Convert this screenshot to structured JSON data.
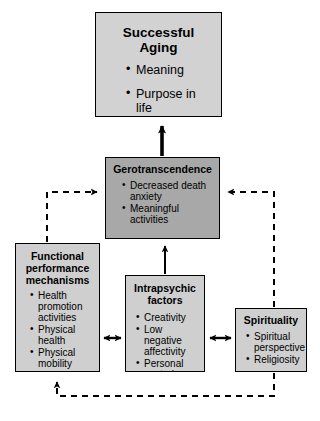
{
  "diagram": {
    "colors": {
      "top_box_fill": "#d2d2d2",
      "gerotranscendence_fill": "#a8a8a8",
      "factor_box_fill": "#cfcfcf",
      "border": "#000000",
      "background": "#ffffff"
    },
    "nodes": {
      "successful_aging": {
        "title": "Successful Aging",
        "items": [
          "Meaning",
          "Purpose in life"
        ]
      },
      "gerotranscendence": {
        "title": "Gerotranscendence",
        "items": [
          "Decreased death anxiety",
          "Meaningful activities"
        ]
      },
      "functional": {
        "title": "Functional performance mechanisms",
        "items": [
          "Health promotion activities",
          "Physical health",
          "Physical mobility"
        ]
      },
      "intrapsychic": {
        "title": "Intrapsychic factors",
        "items": [
          "Creativity",
          "Low negative affectivity",
          "Personal control"
        ]
      },
      "spirituality": {
        "title": "Spirituality",
        "items": [
          "Spiritual perspective",
          "Religiosity"
        ]
      }
    },
    "edges": [
      {
        "name": "gerotranscendence-to-successful-aging",
        "style": "solid",
        "heads": "single"
      },
      {
        "name": "intrapsychic-to-gerotranscendence",
        "style": "solid",
        "heads": "single"
      },
      {
        "name": "functional-to-gerotranscendence",
        "style": "dashed",
        "heads": "single"
      },
      {
        "name": "spirituality-to-gerotranscendence",
        "style": "dashed",
        "heads": "single"
      },
      {
        "name": "functional-intrapsychic",
        "style": "solid",
        "heads": "double"
      },
      {
        "name": "intrapsychic-spirituality",
        "style": "solid",
        "heads": "double"
      },
      {
        "name": "spirituality-to-functional",
        "style": "dashed",
        "heads": "single"
      }
    ]
  }
}
